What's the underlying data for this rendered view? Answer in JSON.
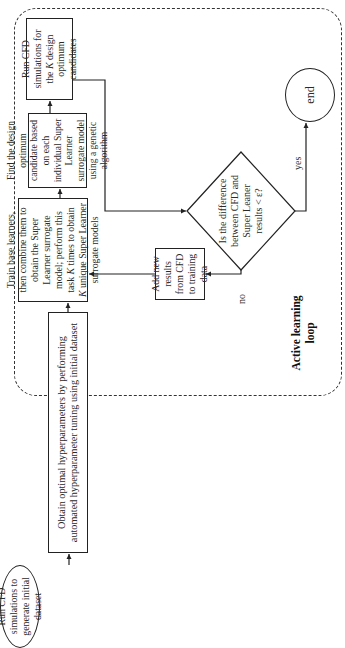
{
  "diagram": {
    "type": "flowchart",
    "orientation": "rotated-90-ccw",
    "nodes": {
      "start": {
        "shape": "ellipse",
        "text": "Run CFD simulations to generate initial dataset"
      },
      "tune": {
        "shape": "rect",
        "text": "Obtain optimal hyperparameters by performing automated hyperparameter tuning using initial dataset"
      },
      "train": {
        "shape": "rect",
        "text_before_k1": "Train base learners, then combine them to obtain the Super Learner surrogate model; perform this task ",
        "k1": "K",
        "text_mid": " times to obtain ",
        "k2": "K",
        "text_after": " unique Super Learner surrogate models"
      },
      "find": {
        "shape": "rect",
        "text": "Find the design optimum candidate based on each individual Super Learner surrogate model using a genetic algorithm"
      },
      "run_k": {
        "shape": "rect",
        "text_before": "Run CFD simulations for the ",
        "k": "K",
        "text_after": " design optimum candidates"
      },
      "decision": {
        "shape": "diamond",
        "text": "Is the difference between CFD and Super Leaner results < ε?"
      },
      "add": {
        "shape": "rect",
        "text": "Add new results from CFD to training data"
      },
      "end": {
        "shape": "ellipse",
        "text": "end"
      }
    },
    "edges": [
      {
        "from": "start",
        "to": "tune",
        "label": ""
      },
      {
        "from": "tune",
        "to": "train",
        "label": ""
      },
      {
        "from": "train",
        "to": "find",
        "label": ""
      },
      {
        "from": "find",
        "to": "run_k",
        "label": ""
      },
      {
        "from": "run_k",
        "to": "decision",
        "label": ""
      },
      {
        "from": "decision",
        "to": "end",
        "label": "yes"
      },
      {
        "from": "decision",
        "to": "add",
        "label": "no"
      },
      {
        "from": "add",
        "to": "train",
        "label": ""
      }
    ],
    "edge_labels": {
      "yes": "yes",
      "no": "no"
    },
    "group": {
      "name": "active-learning-loop",
      "title_line1": "Active learning",
      "title_line2": "loop",
      "border": "dashed"
    }
  },
  "colors": {
    "line": "#222222",
    "background": "#ffffff"
  }
}
